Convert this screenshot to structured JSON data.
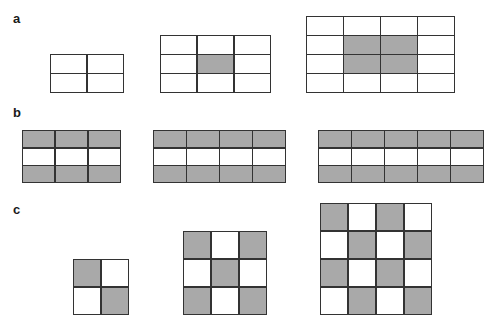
{
  "figure": {
    "colors": {
      "border": "#333333",
      "shaded": "#a9a9a9",
      "empty": "#ffffff"
    },
    "panels": [
      {
        "label": "a",
        "label_pos": [
          13,
          12
        ],
        "grids": [
          {
            "x": 50,
            "y": 54,
            "w": 74,
            "h": 39,
            "rows": 2,
            "cols": 2,
            "shaded": []
          },
          {
            "x": 160,
            "y": 35,
            "w": 111,
            "h": 58,
            "rows": 3,
            "cols": 3,
            "shaded": [
              [
                1,
                1
              ]
            ]
          },
          {
            "x": 306,
            "y": 16,
            "w": 149,
            "h": 77,
            "rows": 4,
            "cols": 4,
            "shaded": [
              [
                1,
                1
              ],
              [
                1,
                2
              ],
              [
                2,
                1
              ],
              [
                2,
                2
              ]
            ]
          }
        ]
      },
      {
        "label": "b",
        "label_pos": [
          13,
          106
        ],
        "grids": [
          {
            "x": 22,
            "y": 130,
            "w": 99,
            "h": 53,
            "rows": 3,
            "cols": 3,
            "shaded": [
              [
                0,
                0
              ],
              [
                0,
                1
              ],
              [
                0,
                2
              ],
              [
                2,
                0
              ],
              [
                2,
                1
              ],
              [
                2,
                2
              ]
            ]
          },
          {
            "x": 153,
            "y": 130,
            "w": 133,
            "h": 53,
            "rows": 3,
            "cols": 4,
            "shaded": [
              [
                0,
                0
              ],
              [
                0,
                1
              ],
              [
                0,
                2
              ],
              [
                0,
                3
              ],
              [
                2,
                0
              ],
              [
                2,
                1
              ],
              [
                2,
                2
              ],
              [
                2,
                3
              ]
            ]
          },
          {
            "x": 318,
            "y": 130,
            "w": 166,
            "h": 53,
            "rows": 3,
            "cols": 5,
            "shaded": [
              [
                0,
                0
              ],
              [
                0,
                1
              ],
              [
                0,
                2
              ],
              [
                0,
                3
              ],
              [
                0,
                4
              ],
              [
                2,
                0
              ],
              [
                2,
                1
              ],
              [
                2,
                2
              ],
              [
                2,
                3
              ],
              [
                2,
                4
              ]
            ]
          }
        ]
      },
      {
        "label": "c",
        "label_pos": [
          13,
          203
        ],
        "grids": [
          {
            "x": 73,
            "y": 259,
            "w": 56,
            "h": 56,
            "rows": 2,
            "cols": 2,
            "shaded": [
              [
                0,
                0
              ],
              [
                1,
                1
              ]
            ]
          },
          {
            "x": 183,
            "y": 231,
            "w": 84,
            "h": 84,
            "rows": 3,
            "cols": 3,
            "shaded": [
              [
                0,
                0
              ],
              [
                0,
                2
              ],
              [
                1,
                1
              ],
              [
                2,
                0
              ],
              [
                2,
                2
              ]
            ]
          },
          {
            "x": 320,
            "y": 203,
            "w": 112,
            "h": 112,
            "rows": 4,
            "cols": 4,
            "shaded": [
              [
                0,
                0
              ],
              [
                0,
                2
              ],
              [
                1,
                1
              ],
              [
                1,
                3
              ],
              [
                2,
                0
              ],
              [
                2,
                2
              ],
              [
                3,
                1
              ],
              [
                3,
                3
              ]
            ]
          }
        ]
      }
    ]
  }
}
